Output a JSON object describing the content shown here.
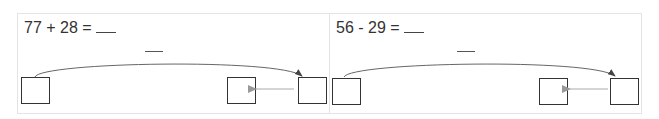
{
  "problems": [
    {
      "expression": "77 + 28 = ",
      "blank": "___",
      "operation": "add"
    },
    {
      "expression": "56 - 29 = ",
      "blank": "___",
      "operation": "subtract"
    }
  ],
  "colors": {
    "border": "#e4e4e4",
    "box": "#333333",
    "arc": "#555555",
    "arrow": "#999999"
  }
}
